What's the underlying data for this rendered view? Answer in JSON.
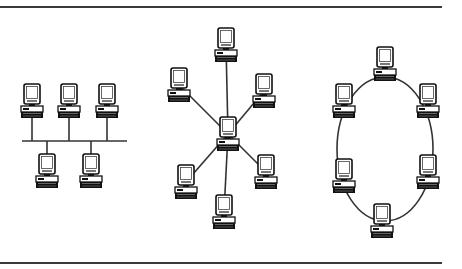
{
  "diagram": {
    "colors": {
      "line": "#333333",
      "device": "#111111",
      "screen": "#ffffff",
      "rule": "#3a3a3a"
    },
    "topologies": [
      {
        "name": "bus",
        "bus_line": {
          "x1": 22,
          "x2": 127,
          "y": 141
        },
        "nodes": [
          {
            "x": 21,
            "y": 84,
            "side": "top"
          },
          {
            "x": 58,
            "y": 84,
            "side": "top"
          },
          {
            "x": 96,
            "y": 84,
            "side": "top"
          },
          {
            "x": 36,
            "y": 154,
            "side": "bottom"
          },
          {
            "x": 80,
            "y": 154,
            "side": "bottom"
          }
        ]
      },
      {
        "name": "star",
        "hub": {
          "x": 217,
          "y": 117
        },
        "nodes": [
          {
            "x": 215,
            "y": 28
          },
          {
            "x": 168,
            "y": 68
          },
          {
            "x": 253,
            "y": 74
          },
          {
            "x": 175,
            "y": 165
          },
          {
            "x": 255,
            "y": 155
          },
          {
            "x": 213,
            "y": 195
          }
        ]
      },
      {
        "name": "ring",
        "ellipse": {
          "cx": 385,
          "cy": 149,
          "rx": 48,
          "ry": 72
        },
        "nodes": [
          {
            "x": 374,
            "y": 47
          },
          {
            "x": 333,
            "y": 84
          },
          {
            "x": 417,
            "y": 84
          },
          {
            "x": 333,
            "y": 159
          },
          {
            "x": 417,
            "y": 155
          },
          {
            "x": 371,
            "y": 204
          }
        ]
      }
    ]
  }
}
